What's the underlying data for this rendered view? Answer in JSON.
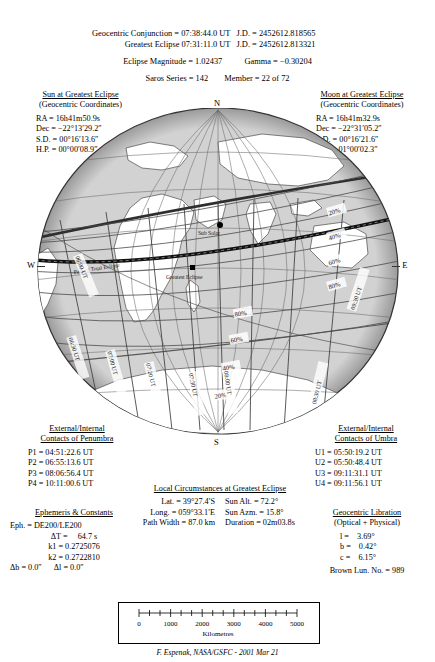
{
  "header": {
    "lines": [
      {
        "label": "Geocentric Conjunction =",
        "value": "07:38:44.0 UT",
        "jd_label": "J.D. =",
        "jd": "2452612.818565"
      },
      {
        "label": "Greatest Eclipse =",
        "value": "07:31:11.0 UT",
        "jd_label": "J.D. =",
        "jd": "2452612.813321"
      }
    ],
    "magnitude_label": "Eclipse Magnitude =",
    "magnitude": "1.02437",
    "gamma_label": "Gamma =",
    "gamma": "−0.30204",
    "saros_label": "Saros Series =",
    "saros": "142",
    "member_label": "Member =",
    "member": "22 of 72"
  },
  "sun_block": {
    "title": "Sun at Greatest Eclipse",
    "subtitle": "(Geocentric Coordinates)",
    "rows": [
      {
        "k": "RA  =",
        "v": "16h41m50.9s"
      },
      {
        "k": "Dec =",
        "v": "−22°13′29.2″"
      },
      {
        "k": "S.D. =",
        "v": "00°16′13.6″"
      },
      {
        "k": "H.P. =",
        "v": "00°00′08.9″"
      }
    ]
  },
  "moon_block": {
    "title": "Moon at Greatest Eclipse",
    "subtitle": "(Geocentric Coordinates)",
    "rows": [
      {
        "k": "RA  =",
        "v": "16h41m32.9s"
      },
      {
        "k": "Dec =",
        "v": "−22°31′05.2″"
      },
      {
        "k": "S.D. =",
        "v": "00°16′21.6″"
      },
      {
        "k": "H.P. =",
        "v": "01°00′02.3″"
      }
    ]
  },
  "penumbra_block": {
    "title_line1": "External/Internal",
    "title_line2": "Contacts of Penumbra",
    "rows": [
      {
        "k": "P1 =",
        "v": "04:51:22.6 UT"
      },
      {
        "k": "P2 =",
        "v": "06:55:13.6 UT"
      },
      {
        "k": "P3 =",
        "v": "08:06:56.4 UT"
      },
      {
        "k": "P4 =",
        "v": "10:11:00.6 UT"
      }
    ]
  },
  "umbra_block": {
    "title_line1": "External/Internal",
    "title_line2": "Contacts of Umbra",
    "rows": [
      {
        "k": "U1 =",
        "v": "05:50:19.2 UT"
      },
      {
        "k": "U2 =",
        "v": "05:50:48.4 UT"
      },
      {
        "k": "U3 =",
        "v": "09:11:31.1 UT"
      },
      {
        "k": "U4 =",
        "v": "09:11:56.1 UT"
      }
    ]
  },
  "ephemeris_block": {
    "title": "Ephemeris & Constants",
    "eph_label": "Eph. =",
    "eph": "DE200/LE200",
    "dt_label": "ΔT =",
    "dt": "64.7 s",
    "k1_label": "k1 =",
    "k1": "0.2725076",
    "k2_label": "k2 =",
    "k2": "0.2722810",
    "db_label": "Δb =",
    "db": "0.0″",
    "dl_label": "Δl =",
    "dl": "0.0″"
  },
  "local_block": {
    "title": "Local Circumstances at Greatest Eclipse",
    "lat_label": "Lat. =",
    "lat": "39°27.4′S",
    "long_label": "Long. =",
    "long": "059°33.1′E",
    "sunalt_label": "Sun Alt. =",
    "sunalt": "72.2°",
    "sunazm_label": "Sun Azm. =",
    "sunazm": "15.8°",
    "pathwidth_label": "Path Width =",
    "pathwidth": "87.0 km",
    "duration_label": "Duration =",
    "duration": "02m03.8s"
  },
  "libration_block": {
    "title": "Geocentric Libration",
    "subtitle": "(Optical + Physical)",
    "rows": [
      {
        "k": "l =",
        "v": "3.69°"
      },
      {
        "k": "b =",
        "v": "0.42°"
      },
      {
        "k": "c =",
        "v": "6.15°"
      }
    ],
    "brown_label": "Brown Lun. No. =",
    "brown": "989"
  },
  "compass": {
    "north": "N",
    "south": "S",
    "west": "W",
    "east": "E"
  },
  "map": {
    "sub_solar_label": "Sub Solar",
    "greatest_eclipse_label": "Greatest Eclipse",
    "path_label": "Path of Total Eclipse",
    "obscuration_labels": [
      "20%",
      "40%",
      "60%",
      "80%",
      "80%",
      "60%",
      "40%",
      "20%"
    ],
    "ut_curve_labels": [
      "06:00 UT",
      "06:30 UT",
      "07:00 UT",
      "07:20 UT",
      "07:30 UT",
      "08:00 UT",
      "08:30 UT",
      "09:30 UT"
    ]
  },
  "scale": {
    "ticks": [
      "0",
      "1000",
      "2000",
      "3000",
      "4000",
      "5000"
    ],
    "unit": "Kilometres"
  },
  "credit": "F. Espenak, NASA/GSFC - 2001 Mar 21",
  "colors": {
    "ocean": "#d2d2d2",
    "land": "#ffffff",
    "outline": "#555555",
    "grid": "#6a6a6a",
    "penumbra_edge": "#3a3a3a",
    "path": "#1a1a1a"
  }
}
